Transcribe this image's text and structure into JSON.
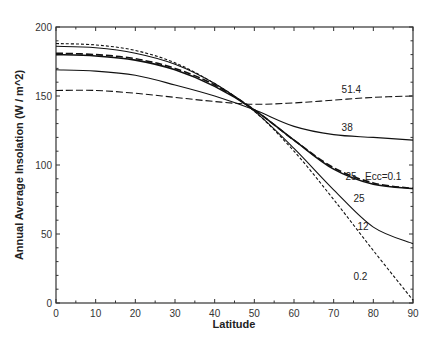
{
  "chart_data": {
    "type": "line",
    "title": "",
    "xlabel": "Latitude",
    "ylabel": "Annual Average Insolation    (W / m^2)",
    "xlim": [
      0,
      90
    ],
    "ylim": [
      0,
      200
    ],
    "x_ticks": [
      0,
      10,
      20,
      30,
      40,
      50,
      60,
      70,
      80,
      90
    ],
    "y_ticks": [
      0,
      50,
      100,
      150,
      200
    ],
    "grid": false,
    "legend": "inline labels",
    "x": [
      0,
      10,
      20,
      30,
      40,
      50,
      60,
      70,
      80,
      90
    ],
    "series": [
      {
        "name": "51.4",
        "style": "dashed",
        "label_pos": [
          72,
          152
        ],
        "values": [
          154,
          154,
          152,
          149,
          146,
          144,
          145,
          147,
          149,
          150
        ]
      },
      {
        "name": "38",
        "style": "solid",
        "label_pos": [
          72,
          125
        ],
        "values": [
          169,
          168,
          165,
          158,
          150,
          140,
          128,
          122,
          120,
          118
        ]
      },
      {
        "name": "25 Ecc=0.1",
        "style": "dashed",
        "label_pos": [
          73,
          89
        ],
        "values": [
          181,
          180,
          177,
          170,
          158,
          140,
          118,
          98,
          87,
          83
        ]
      },
      {
        "name": "25",
        "style": "solid",
        "label_pos": [
          75,
          73
        ],
        "values": [
          180,
          179,
          176,
          169,
          157,
          140,
          118,
          97,
          86,
          83
        ]
      },
      {
        "name": "12",
        "style": "solid",
        "label_pos": [
          76,
          53
        ],
        "values": [
          186,
          185,
          181,
          173,
          159,
          139,
          112,
          82,
          55,
          43
        ]
      },
      {
        "name": "0.2",
        "style": "dashed",
        "label_pos": [
          75,
          17
        ],
        "values": [
          188,
          187,
          183,
          174,
          159,
          139,
          110,
          75,
          38,
          2
        ]
      }
    ]
  },
  "axes": {
    "xlabel": "Latitude",
    "ylabel": "Annual Average Insolation    (W / m^2)"
  }
}
